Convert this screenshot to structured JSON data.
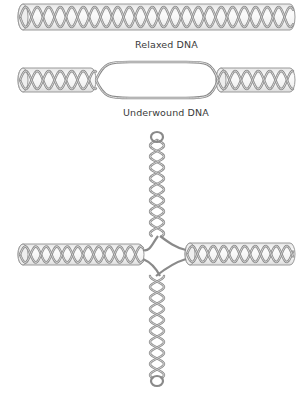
{
  "diagram": {
    "panels": [
      {
        "id": "relaxed",
        "label": "Relaxed DNA",
        "structure": "continuous double helix in cylinder"
      },
      {
        "id": "underwound",
        "label": "Underwound DNA",
        "structure": "double helix with central strand-separated bubble"
      },
      {
        "id": "cruciform",
        "label": "",
        "structure": "cruciform: horizontal helical arms with vertical hairpin helices extruded above and below junction"
      }
    ],
    "colors": {
      "strand": "#8a8a8a",
      "strand_light": "#c8c8c8",
      "tube_outline": "#9a9a9a",
      "tube_fill": "#f4f4f4",
      "text": "#3a3a3a",
      "background": "#ffffff"
    }
  }
}
